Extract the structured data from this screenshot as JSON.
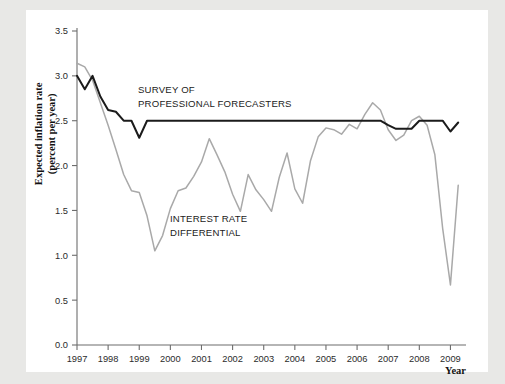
{
  "figure": {
    "background": "#e8e8e6",
    "card_background": "#ffffff"
  },
  "axes": {
    "y_title_line1": "Expected inflation rate",
    "y_title_line2": "(percent per year)",
    "x_title": "Year",
    "y_ticks": [
      "0.0",
      "0.5",
      "1.0",
      "1.5",
      "2.0",
      "2.5",
      "3.0",
      "3.5"
    ],
    "x_ticks": [
      "1997",
      "1998",
      "1999",
      "2000",
      "2001",
      "2002",
      "2003",
      "2004",
      "2005",
      "2006",
      "2007",
      "2008",
      "2009"
    ]
  },
  "annotations": {
    "survey_line1": "SURVEY OF",
    "survey_line2": "PROFESSIONAL FORECASTERS",
    "differential_line1": "INTEREST RATE",
    "differential_line2": "DIFFERENTIAL"
  },
  "chart_data": {
    "type": "line",
    "title": "",
    "xlabel": "Year",
    "ylabel": "Expected inflation rate (percent per year)",
    "xlim": [
      1997.0,
      2009.5
    ],
    "ylim": [
      0.0,
      3.5
    ],
    "grid": false,
    "legend_position": "inline-annotation",
    "colors": {
      "survey_of_professional_forecasters": "#1b1b1b",
      "interest_rate_differential": "#a9a9a9"
    },
    "series": [
      {
        "name": "SURVEY OF PROFESSIONAL FORECASTERS",
        "color": "#1b1b1b",
        "x": [
          1997.0,
          1997.25,
          1997.5,
          1997.75,
          1998.0,
          1998.25,
          1998.5,
          1998.75,
          1999.0,
          1999.25,
          1999.5,
          1999.75,
          2000.0,
          2000.25,
          2000.5,
          2000.75,
          2001.0,
          2001.25,
          2001.5,
          2001.75,
          2002.0,
          2002.25,
          2002.5,
          2002.75,
          2003.0,
          2003.25,
          2003.5,
          2003.75,
          2004.0,
          2004.25,
          2004.5,
          2004.75,
          2005.0,
          2005.25,
          2005.5,
          2005.75,
          2006.0,
          2006.25,
          2006.5,
          2006.75,
          2007.0,
          2007.25,
          2007.5,
          2007.75,
          2008.0,
          2008.25,
          2008.5,
          2008.75,
          2009.0,
          2009.25
        ],
        "y": [
          3.0,
          2.85,
          3.0,
          2.77,
          2.62,
          2.6,
          2.5,
          2.5,
          2.31,
          2.5,
          2.5,
          2.5,
          2.5,
          2.5,
          2.5,
          2.5,
          2.5,
          2.5,
          2.5,
          2.5,
          2.5,
          2.5,
          2.5,
          2.5,
          2.5,
          2.5,
          2.5,
          2.5,
          2.5,
          2.5,
          2.5,
          2.5,
          2.5,
          2.5,
          2.5,
          2.5,
          2.5,
          2.5,
          2.5,
          2.5,
          2.45,
          2.41,
          2.41,
          2.41,
          2.5,
          2.5,
          2.5,
          2.5,
          2.38,
          2.48
        ]
      },
      {
        "name": "INTEREST RATE DIFFERENTIAL",
        "color": "#a9a9a9",
        "x": [
          1997.0,
          1997.25,
          1997.5,
          1997.75,
          1998.0,
          1998.25,
          1998.5,
          1998.75,
          1999.0,
          1999.25,
          1999.5,
          1999.75,
          2000.0,
          2000.25,
          2000.5,
          2000.75,
          2001.0,
          2001.25,
          2001.5,
          2001.75,
          2002.0,
          2002.25,
          2002.5,
          2002.75,
          2003.0,
          2003.25,
          2003.5,
          2003.75,
          2004.0,
          2004.25,
          2004.5,
          2004.75,
          2005.0,
          2005.25,
          2005.5,
          2005.75,
          2006.0,
          2006.25,
          2006.5,
          2006.75,
          2007.0,
          2007.25,
          2007.5,
          2007.75,
          2008.0,
          2008.25,
          2008.5,
          2008.75,
          2009.0,
          2009.25
        ],
        "y": [
          3.14,
          3.1,
          2.95,
          2.7,
          2.45,
          2.18,
          1.9,
          1.72,
          1.7,
          1.44,
          1.05,
          1.22,
          1.52,
          1.72,
          1.75,
          1.88,
          2.04,
          2.3,
          2.12,
          1.93,
          1.68,
          1.49,
          1.9,
          1.73,
          1.62,
          1.49,
          1.87,
          2.14,
          1.74,
          1.58,
          2.05,
          2.32,
          2.42,
          2.4,
          2.35,
          2.46,
          2.41,
          2.57,
          2.7,
          2.62,
          2.4,
          2.28,
          2.34,
          2.5,
          2.55,
          2.45,
          2.12,
          1.3,
          0.67,
          1.78
        ]
      }
    ]
  }
}
